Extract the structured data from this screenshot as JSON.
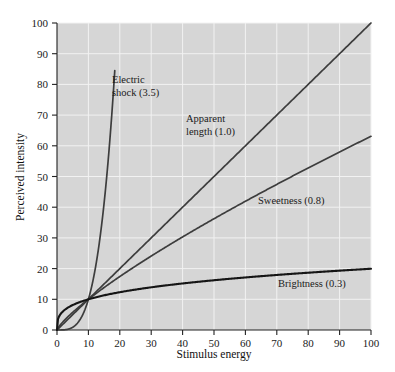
{
  "chart_data": {
    "type": "line",
    "title": "",
    "subtitle": "",
    "xlabel": "Stimulus energy",
    "ylabel": "Perceived intensity",
    "xlim": [
      0,
      100
    ],
    "ylim": [
      0,
      100
    ],
    "xticks": [
      0,
      10,
      20,
      30,
      40,
      50,
      60,
      70,
      80,
      90,
      100
    ],
    "yticks": [
      0,
      10,
      20,
      30,
      40,
      50,
      60,
      70,
      80,
      90,
      100
    ],
    "xtick_labels": [
      "0",
      "10",
      "20",
      "30",
      "40",
      "50",
      "60",
      "70",
      "80",
      "90",
      "100"
    ],
    "ytick_labels": [
      "0",
      "10",
      "20",
      "30",
      "40",
      "50",
      "60",
      "70",
      "80",
      "90",
      "100"
    ],
    "grid": true,
    "grid_color": "#f2f2f2",
    "plot_bg": "#d6d6d6",
    "figure_bg": "#ffffff",
    "legend_position": "inline-annotations",
    "note": "Stevens power law: y = 10 * (x/10)^n, all curves intersect at (10,10)",
    "series": [
      {
        "name": "Electric shock",
        "exponent": 3.5,
        "label": "Electric shock (3.5)",
        "color": "#3d3d3d",
        "x": [
          0,
          1,
          2,
          3,
          4,
          5,
          6,
          7,
          8,
          9,
          10,
          11,
          12,
          13,
          14,
          15,
          16,
          17,
          18
        ],
        "y": [
          0,
          0.0032,
          0.035,
          0.146,
          0.4,
          0.88,
          1.67,
          2.88,
          4.57,
          6.84,
          10,
          13.9,
          18.9,
          25.0,
          32.5,
          41.4,
          51.9,
          64.2,
          78.3
        ],
        "x_end": 18.4,
        "y_end": 95
      },
      {
        "name": "Apparent length",
        "exponent": 1.0,
        "label": "Apparent length (1.0)",
        "color": "#3d3d3d",
        "x": [
          0,
          10,
          20,
          30,
          40,
          50,
          60,
          70,
          80,
          90,
          100
        ],
        "y": [
          0,
          10,
          20,
          30,
          40,
          50,
          60,
          70,
          80,
          90,
          100
        ],
        "x_end": 100,
        "y_end": 100
      },
      {
        "name": "Sweetness",
        "exponent": 0.8,
        "label": "Sweetness (0.8)",
        "color": "#3d3d3d",
        "x": [
          0,
          5,
          10,
          20,
          30,
          40,
          50,
          60,
          70,
          80,
          90,
          100
        ],
        "y": [
          0,
          5.74,
          10,
          17.4,
          24.0,
          30.3,
          36.2,
          41.9,
          47.4,
          52.8,
          58.0,
          63.1
        ],
        "x_end": 100,
        "y_end": 63.1
      },
      {
        "name": "Brightness",
        "exponent": 0.3,
        "label": "Brightness (0.3)",
        "color": "#151515",
        "x": [
          0,
          1,
          2,
          5,
          10,
          20,
          30,
          40,
          50,
          60,
          70,
          80,
          90,
          100
        ],
        "y": [
          0,
          5.01,
          6.17,
          8.06,
          10,
          12.3,
          13.9,
          15.2,
          16.2,
          17.1,
          17.9,
          18.6,
          19.2,
          19.95
        ],
        "x_end": 100,
        "y_end": 20.5
      }
    ],
    "annotations": [
      {
        "text_line1": "Electric",
        "text_line2": "shock (3.5)",
        "x_px": 112,
        "y_px": 83
      },
      {
        "text_line1": "Apparent",
        "text_line2": "length (1.0)",
        "x_px": 186,
        "y_px": 122
      },
      {
        "text_line1": "Sweetness (0.8)",
        "text_line2": "",
        "x_px": 258,
        "y_px": 204
      },
      {
        "text_line1": "Brightness (0.3)",
        "text_line2": "",
        "x_px": 278,
        "y_px": 287
      }
    ]
  }
}
